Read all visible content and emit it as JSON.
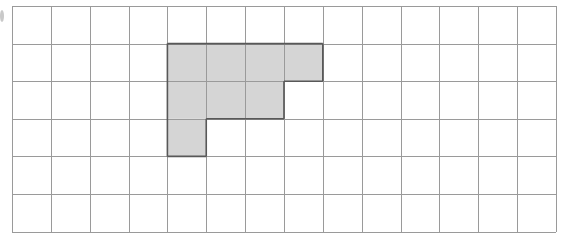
{
  "figure": {
    "type": "grid-shading-figure",
    "grid": {
      "columns": 14,
      "rows": 6,
      "origin_x": 12,
      "origin_y": 6,
      "cell_width": 38.85,
      "cell_height": 37.6,
      "line_color": "#9a9a9a",
      "line_width": 1,
      "background_color": "#ffffff"
    },
    "shading": {
      "fill_color": "#d5d5d5",
      "outline_color": "#585858",
      "outline_width": 1.6,
      "shaded_cell_count": 8,
      "description": "Staircase / L-shaped polyomino of 8 unit squares",
      "rows": [
        {
          "row_index": 0,
          "shaded_columns": []
        },
        {
          "row_index": 1,
          "shaded_columns": [
            4,
            5,
            6,
            7
          ]
        },
        {
          "row_index": 2,
          "shaded_columns": [
            4,
            5,
            6
          ]
        },
        {
          "row_index": 3,
          "shaded_columns": [
            4
          ]
        },
        {
          "row_index": 4,
          "shaded_columns": []
        },
        {
          "row_index": 5,
          "shaded_columns": []
        }
      ]
    },
    "artifact": {
      "name": "page-edge-mark",
      "x": 0,
      "y": 10,
      "width": 4,
      "height": 12,
      "color": "#c9c9c9"
    }
  }
}
